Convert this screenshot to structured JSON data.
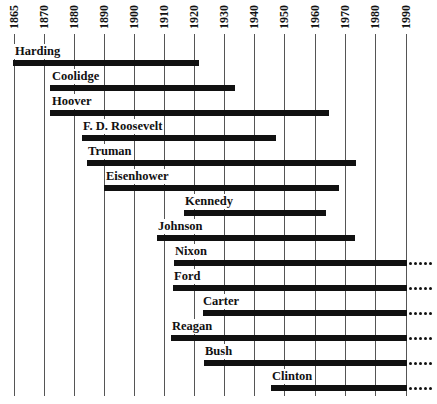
{
  "chart_data": {
    "type": "bar",
    "subtype": "timeline-range",
    "title": "",
    "xlabel": "",
    "ylabel": "",
    "x_ticks": [
      "1865",
      "1870",
      "1880",
      "1890",
      "1900",
      "1910",
      "1920",
      "1930",
      "1940",
      "1950",
      "1960",
      "1970",
      "1980",
      "1990"
    ],
    "xlim": [
      1865,
      1993
    ],
    "grid": true,
    "legend": "none",
    "ongoing_marker": "dotted continuation past 1990",
    "series": [
      {
        "name": "Harding",
        "start": 1865,
        "end": 1923,
        "ongoing": false
      },
      {
        "name": "Coolidge",
        "start": 1872,
        "end": 1933,
        "ongoing": false
      },
      {
        "name": "Hoover",
        "start": 1874,
        "end": 1964,
        "ongoing": false
      },
      {
        "name": "F. D. Roosevelt",
        "start": 1882,
        "end": 1945,
        "ongoing": false
      },
      {
        "name": "Truman",
        "start": 1884,
        "end": 1972,
        "ongoing": false
      },
      {
        "name": "Eisenhower",
        "start": 1890,
        "end": 1969,
        "ongoing": false
      },
      {
        "name": "Kennedy",
        "start": 1917,
        "end": 1963,
        "ongoing": false
      },
      {
        "name": "Johnson",
        "start": 1908,
        "end": 1973,
        "ongoing": false
      },
      {
        "name": "Nixon",
        "start": 1913,
        "end": 1990,
        "ongoing": true
      },
      {
        "name": "Ford",
        "start": 1913,
        "end": 1990,
        "ongoing": true
      },
      {
        "name": "Carter",
        "start": 1924,
        "end": 1990,
        "ongoing": true
      },
      {
        "name": "Reagan",
        "start": 1911,
        "end": 1990,
        "ongoing": true
      },
      {
        "name": "Bush",
        "start": 1924,
        "end": 1990,
        "ongoing": true
      },
      {
        "name": "Clinton",
        "start": 1946,
        "end": 1990,
        "ongoing": true
      }
    ]
  },
  "layout": {
    "tick_x": [
      14,
      44,
      74,
      104,
      134,
      164,
      194,
      224,
      254,
      284,
      315,
      345,
      375,
      406
    ],
    "rows": [
      {
        "label_x": 14,
        "bar_x0": 13,
        "bar_x1": 199,
        "y": 44
      },
      {
        "label_x": 51,
        "bar_x0": 50,
        "bar_x1": 235,
        "y": 69
      },
      {
        "label_x": 51,
        "bar_x0": 50,
        "bar_x1": 329,
        "y": 94
      },
      {
        "label_x": 82,
        "bar_x0": 82,
        "bar_x1": 276,
        "y": 119
      },
      {
        "label_x": 87,
        "bar_x0": 87,
        "bar_x1": 356,
        "y": 144
      },
      {
        "label_x": 105,
        "bar_x0": 104,
        "bar_x1": 339,
        "y": 169
      },
      {
        "label_x": 184,
        "bar_x0": 184,
        "bar_x1": 326,
        "y": 194
      },
      {
        "label_x": 157,
        "bar_x0": 157,
        "bar_x1": 355,
        "y": 219
      },
      {
        "label_x": 174,
        "bar_x0": 174,
        "bar_x1": 407,
        "y": 244
      },
      {
        "label_x": 173,
        "bar_x0": 173,
        "bar_x1": 407,
        "y": 269
      },
      {
        "label_x": 202,
        "bar_x0": 203,
        "bar_x1": 407,
        "y": 294
      },
      {
        "label_x": 171,
        "bar_x0": 171,
        "bar_x1": 407,
        "y": 319
      },
      {
        "label_x": 204,
        "bar_x0": 204,
        "bar_x1": 407,
        "y": 344
      },
      {
        "label_x": 271,
        "bar_x0": 271,
        "bar_x1": 407,
        "y": 369
      }
    ]
  },
  "colors": {
    "bar": "#111111",
    "grid": "#555555",
    "background": "#ffffff"
  }
}
